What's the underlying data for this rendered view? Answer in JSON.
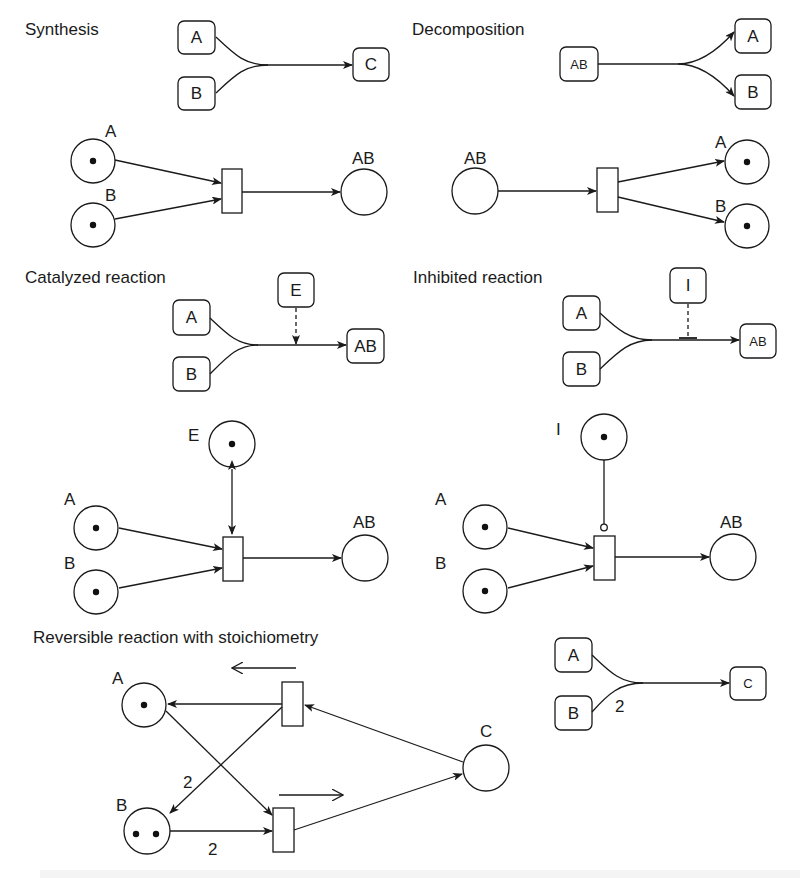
{
  "figure": {
    "colors": {
      "ink": "#1a1a1a",
      "background": "#ffffff"
    },
    "panels": {
      "synthesis": {
        "title": "Synthesis",
        "scheme": {
          "inputs": [
            "A",
            "B"
          ],
          "output": "C"
        },
        "petri_net": {
          "places": [
            {
              "label": "A",
              "tokens": 1
            },
            {
              "label": "B",
              "tokens": 1
            },
            {
              "label": "AB",
              "tokens": 0
            }
          ]
        }
      },
      "decomposition": {
        "title": "Decomposition",
        "scheme": {
          "input": "AB",
          "outputs": [
            "A",
            "B"
          ]
        },
        "petri_net": {
          "places": [
            {
              "label": "AB",
              "tokens": 0
            },
            {
              "label": "A",
              "tokens": 1
            },
            {
              "label": "B",
              "tokens": 1
            }
          ]
        }
      },
      "catalyzed": {
        "title": "Catalyzed reaction",
        "scheme": {
          "inputs": [
            "A",
            "B"
          ],
          "catalyst": "E",
          "output": "AB"
        },
        "petri_net": {
          "places": [
            {
              "label": "E",
              "tokens": 1
            },
            {
              "label": "A",
              "tokens": 1
            },
            {
              "label": "B",
              "tokens": 1
            },
            {
              "label": "AB",
              "tokens": 0
            }
          ]
        }
      },
      "inhibited": {
        "title": "Inhibited reaction",
        "scheme": {
          "inputs": [
            "A",
            "B"
          ],
          "inhibitor": "I",
          "output": "AB"
        },
        "petri_net": {
          "places": [
            {
              "label": "I",
              "tokens": 1
            },
            {
              "label": "A",
              "tokens": 1
            },
            {
              "label": "B",
              "tokens": 1
            },
            {
              "label": "AB",
              "tokens": 0
            }
          ]
        }
      },
      "reversible": {
        "title": "Reversible reaction with stoichiometry",
        "petri_net": {
          "places": [
            {
              "label": "A",
              "tokens": 1
            },
            {
              "label": "B",
              "tokens": 2
            },
            {
              "label": "C",
              "tokens": 0
            }
          ],
          "arc_weights": [
            "2",
            "2"
          ]
        },
        "scheme": {
          "inputs": [
            "A",
            "B"
          ],
          "output": "C",
          "weight_B": "2"
        }
      }
    }
  }
}
